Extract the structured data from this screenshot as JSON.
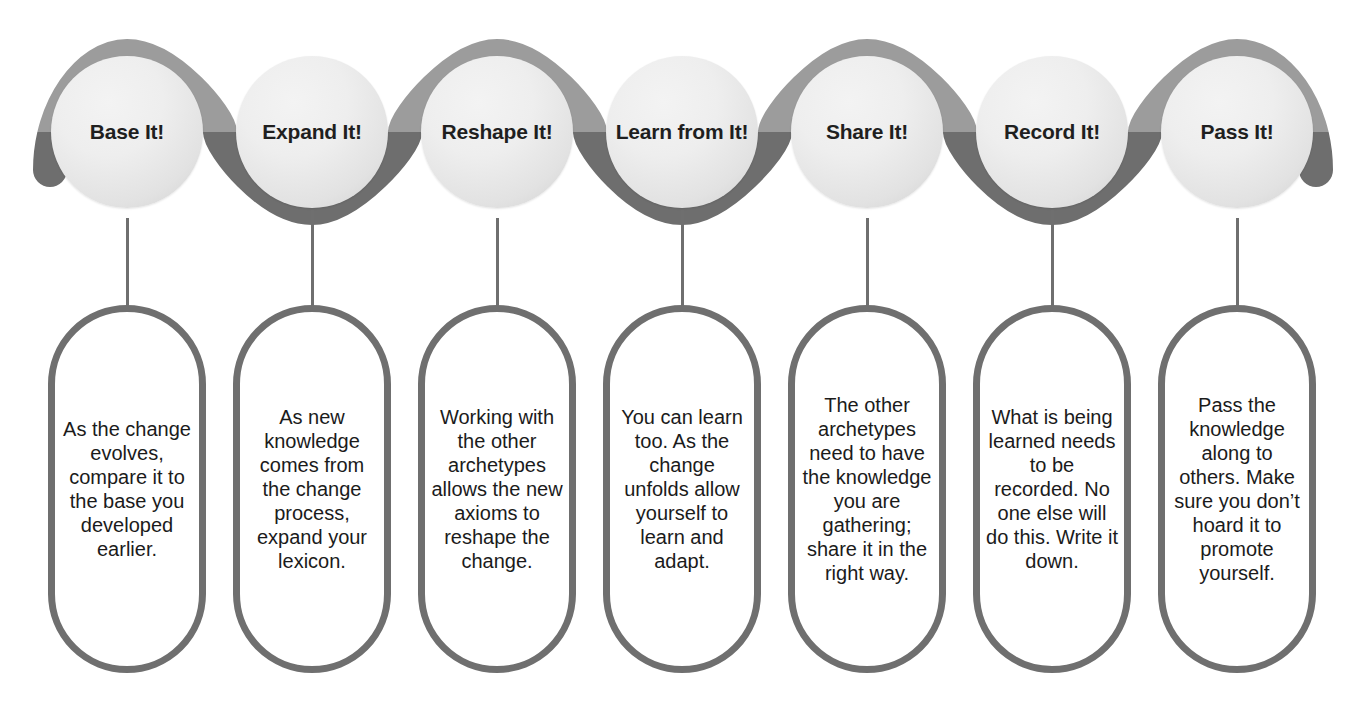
{
  "diagram": {
    "colors": {
      "ribbon_light": "#9c9c9c",
      "ribbon_dark": "#6e6e6e",
      "circle_fill": "#ececec",
      "outline": "#6f6f6f",
      "text": "#1b1b1b",
      "background": "#ffffff"
    },
    "steps": [
      {
        "id": "base-it",
        "label": "Base It!",
        "body": "As the change evolves, compare it to the base you developed earlier."
      },
      {
        "id": "expand-it",
        "label": "Expand It!",
        "body": "As new knowledge comes from the change process, expand your lexicon."
      },
      {
        "id": "reshape-it",
        "label": "Reshape It!",
        "body": "Working with the other archetypes allows the new axioms to reshape the change."
      },
      {
        "id": "learn-from-it",
        "label": "Learn from It!",
        "body": "You can learn too. As the change unfolds allow yourself to learn and adapt."
      },
      {
        "id": "share-it",
        "label": "Share It!",
        "body": "The other archetypes need to have the knowledge you are gathering; share it in the right way."
      },
      {
        "id": "record-it",
        "label": "Record It!",
        "body": "What is being learned needs to be recorded. No one else will do this. Write it down."
      },
      {
        "id": "pass-it",
        "label": "Pass It!",
        "body": "Pass the knowledge along to others. Make sure you don’t hoard it to promote yourself."
      }
    ]
  }
}
